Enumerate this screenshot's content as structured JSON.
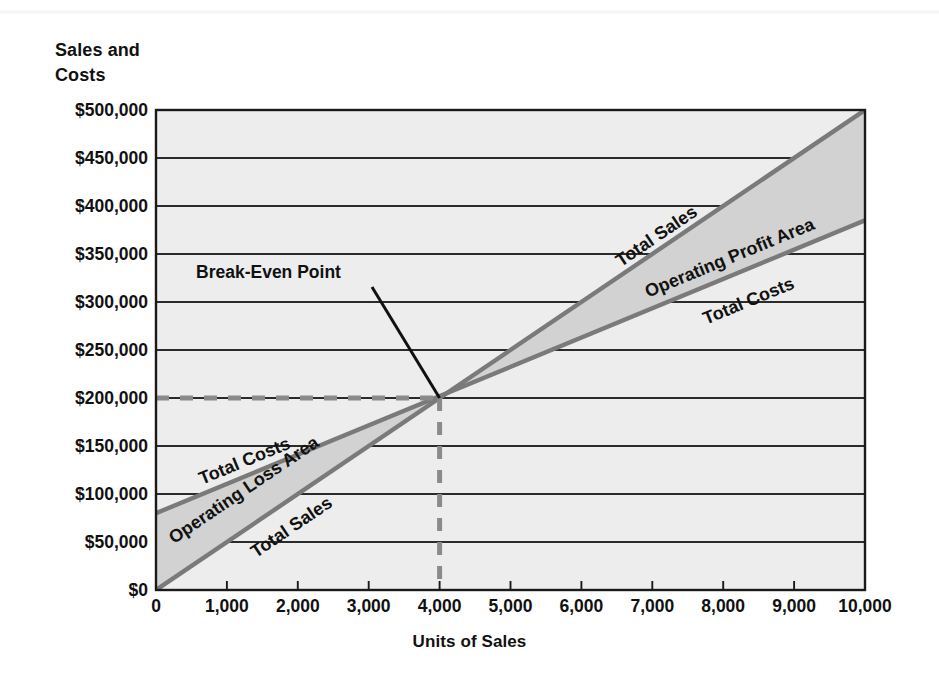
{
  "figure": {
    "y_axis_title": "Sales and\nCosts",
    "x_axis_title": "Units of Sales",
    "callout_label": "Break-Even Point"
  },
  "labels": {
    "total_sales_left": "Total Sales",
    "total_sales_right": "Total Sales",
    "total_costs_left": "Total Costs",
    "total_costs_right": "Total Costs",
    "operating_loss_area": "Operating Loss Area",
    "operating_profit_area": "Operating Profit Area"
  },
  "colors": {
    "plot_background": "#ededed",
    "band_fill": "#d2d2d2",
    "line_stroke": "#7a7a7a",
    "gridline": "#2b2b2b",
    "axis": "#1a1a1a",
    "dash_guide": "#8a8a8a",
    "leader_line": "#111111",
    "text": "#111111"
  },
  "chart_data": {
    "type": "line",
    "title": "",
    "subtitle": "",
    "xlabel": "Units of Sales",
    "ylabel": "Sales and Costs",
    "xlim": [
      0,
      10000
    ],
    "ylim": [
      0,
      500000
    ],
    "grid": true,
    "legend_position": "inline-annotations",
    "x_ticks": [
      0,
      1000,
      2000,
      3000,
      4000,
      5000,
      6000,
      7000,
      8000,
      9000,
      10000
    ],
    "x_tick_labels": [
      "0",
      "1,000",
      "2,000",
      "3,000",
      "4,000",
      "5,000",
      "6,000",
      "7,000",
      "8,000",
      "9,000",
      "10,000"
    ],
    "y_ticks": [
      0,
      50000,
      100000,
      150000,
      200000,
      250000,
      300000,
      350000,
      400000,
      450000,
      500000
    ],
    "y_tick_labels": [
      "$0",
      "$50,000",
      "$100,000",
      "$150,000",
      "$200,000",
      "$250,000",
      "$300,000",
      "$350,000",
      "$400,000",
      "$450,000",
      "$500,000"
    ],
    "series": [
      {
        "name": "Total Sales",
        "x": [
          0,
          10000
        ],
        "values": [
          0,
          500000
        ],
        "slope_per_unit": 50,
        "intercept": 0
      },
      {
        "name": "Total Costs",
        "x": [
          0,
          10000
        ],
        "values": [
          80000,
          385000
        ],
        "slope_per_unit": 30.5,
        "intercept": 80000
      }
    ],
    "annotations": [
      {
        "name": "break-even-point",
        "label": "Break-Even Point",
        "x": 4000,
        "y": 200000
      },
      {
        "name": "operating-loss-area",
        "label": "Operating Loss Area",
        "x_range": [
          0,
          4000
        ]
      },
      {
        "name": "operating-profit-area",
        "label": "Operating Profit Area",
        "x_range": [
          4000,
          10000
        ]
      }
    ]
  }
}
